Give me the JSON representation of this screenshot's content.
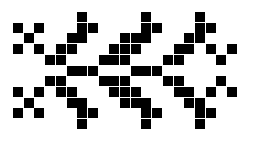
{
  "pattern": {
    "description": "black square pixel-grid pattern on white",
    "colors": {
      "background": "#ffffff",
      "cell": "#000000"
    },
    "grid": {
      "cols": 21,
      "rows": 11,
      "origin_x": 13,
      "origin_y": 12,
      "pitch": 10.7,
      "cell_size": 10
    },
    "rows": [
      [
        6,
        12,
        17
      ],
      [
        0,
        2,
        6,
        7,
        12,
        13,
        17,
        18
      ],
      [
        1,
        5,
        6,
        10,
        11,
        12,
        16,
        17
      ],
      [
        0,
        2,
        4,
        5,
        9,
        10,
        11,
        15,
        16,
        18,
        20
      ],
      [
        3,
        4,
        8,
        9,
        10,
        14,
        15,
        19
      ],
      [
        5,
        6,
        7,
        11,
        12,
        13
      ],
      [
        3,
        4,
        8,
        9,
        10,
        14,
        15,
        19
      ],
      [
        0,
        2,
        4,
        5,
        9,
        10,
        11,
        15,
        16,
        18,
        20
      ],
      [
        1,
        5,
        6,
        10,
        11,
        12,
        16,
        17
      ],
      [
        0,
        2,
        6,
        7,
        12,
        13,
        17,
        18
      ],
      [
        6,
        12,
        17
      ]
    ]
  }
}
